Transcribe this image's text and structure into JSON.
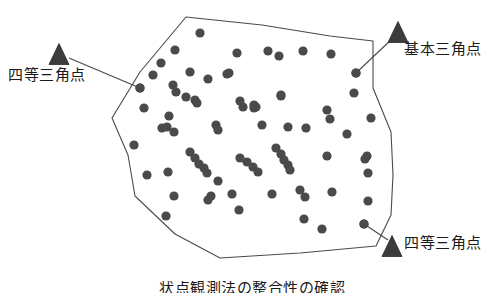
{
  "figure": {
    "type": "survey-point-distribution-diagram",
    "background_color": "#ffffff",
    "area": {
      "name": "survey-area-polygon",
      "stroke_color": "#4a4a4a",
      "fill_color": "#ffffff",
      "stroke_width": 1.1,
      "vertices": [
        [
          186,
          17
        ],
        [
          262,
          25
        ],
        [
          330,
          36
        ],
        [
          373,
          41
        ],
        [
          373,
          88
        ],
        [
          391,
          132
        ],
        [
          393,
          175
        ],
        [
          391,
          215
        ],
        [
          376,
          246
        ],
        [
          300,
          253
        ],
        [
          220,
          258
        ],
        [
          175,
          234
        ],
        [
          135,
          196
        ],
        [
          128,
          155
        ],
        [
          112,
          118
        ],
        [
          140,
          72
        ]
      ]
    },
    "markers": [
      {
        "name": "triangle-marker-left",
        "label": "四等三角点",
        "triangle": {
          "cx": 59,
          "cy": 54,
          "half_width": 10,
          "height": 21
        },
        "leader": {
          "x1": 69,
          "y1": 58,
          "x2": 140,
          "y2": 88
        },
        "anchor_dot": [
          140,
          88
        ]
      },
      {
        "name": "triangle-marker-top-right",
        "label": "基本三角点",
        "triangle": {
          "cx": 398,
          "cy": 32,
          "half_width": 10,
          "height": 21
        },
        "leader": {
          "x1": 393,
          "y1": 38,
          "x2": 356,
          "y2": 73
        },
        "anchor_dot": [
          356,
          73
        ]
      },
      {
        "name": "triangle-marker-bottom-right",
        "label": "四等三角点",
        "triangle": {
          "cx": 392,
          "cy": 246,
          "half_width": 10,
          "height": 21
        },
        "leader": {
          "x1": 388,
          "y1": 240,
          "x2": 364,
          "y2": 224
        },
        "anchor_dot": [
          364,
          224
        ]
      }
    ],
    "points": {
      "name": "gps-observation-points",
      "color": "#4a4a4a",
      "radius": 4.6,
      "count": 78,
      "coordinates": [
        [
          200,
          33
        ],
        [
          175,
          50
        ],
        [
          161,
          63
        ],
        [
          237,
          53
        ],
        [
          268,
          51
        ],
        [
          279,
          56
        ],
        [
          303,
          51
        ],
        [
          331,
          54
        ],
        [
          140,
          88
        ],
        [
          153,
          75
        ],
        [
          190,
          72
        ],
        [
          208,
          79
        ],
        [
          227,
          74
        ],
        [
          229,
          73
        ],
        [
          356,
          73
        ],
        [
          354,
          93
        ],
        [
          144,
          108
        ],
        [
          173,
          85
        ],
        [
          176,
          92
        ],
        [
          186,
          97
        ],
        [
          195,
          100
        ],
        [
          197,
          103
        ],
        [
          254,
          105
        ],
        [
          254,
          108
        ],
        [
          256,
          107
        ],
        [
          281,
          95
        ],
        [
          281,
          96
        ],
        [
          240,
          101
        ],
        [
          243,
          107
        ],
        [
          327,
          110
        ],
        [
          330,
          119
        ],
        [
          371,
          118
        ],
        [
          167,
          127
        ],
        [
          174,
          132
        ],
        [
          216,
          125
        ],
        [
          218,
          130
        ],
        [
          262,
          125
        ],
        [
          288,
          127
        ],
        [
          306,
          128
        ],
        [
          347,
          134
        ],
        [
          134,
          145
        ],
        [
          162,
          128
        ],
        [
          169,
          116
        ],
        [
          276,
          148
        ],
        [
          281,
          154
        ],
        [
          284,
          160
        ],
        [
          288,
          165
        ],
        [
          290,
          170
        ],
        [
          240,
          158
        ],
        [
          247,
          162
        ],
        [
          253,
          167
        ],
        [
          258,
          172
        ],
        [
          168,
          172
        ],
        [
          190,
          152
        ],
        [
          195,
          158
        ],
        [
          199,
          164
        ],
        [
          204,
          168
        ],
        [
          207,
          173
        ],
        [
          327,
          156
        ],
        [
          367,
          156
        ],
        [
          368,
          173
        ],
        [
          147,
          175
        ],
        [
          218,
          181
        ],
        [
          174,
          196
        ],
        [
          232,
          194
        ],
        [
          272,
          194
        ],
        [
          300,
          190
        ],
        [
          332,
          192
        ],
        [
          365,
          159
        ],
        [
          364,
          224
        ],
        [
          368,
          201
        ],
        [
          166,
          216
        ],
        [
          208,
          200
        ],
        [
          305,
          197
        ],
        [
          239,
          210
        ],
        [
          304,
          219
        ],
        [
          211,
          196
        ],
        [
          322,
          229
        ]
      ]
    },
    "labels": {
      "left": "四等三角点",
      "top_right": "基本三角点",
      "bottom_right": "四等三角点"
    },
    "caption": "状点観測法の整合性の確認"
  }
}
